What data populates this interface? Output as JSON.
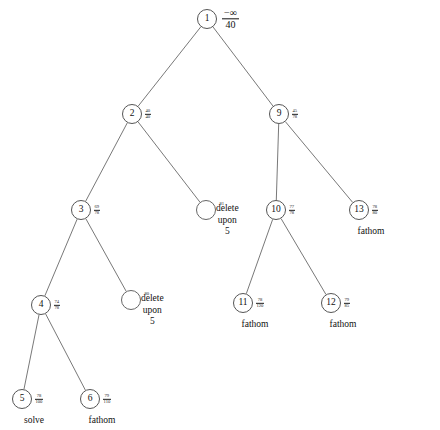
{
  "figure": {
    "type": "branch-and-bound-search-tree",
    "background": "#ffffff",
    "line_color": "#555555",
    "text_color": "#111111"
  },
  "nodes": [
    {
      "id": "n1",
      "label": "1",
      "x": 207,
      "y": 19,
      "bound_num": "−∞",
      "bound_den": "40",
      "status": ""
    },
    {
      "id": "n2",
      "label": "2",
      "x": 132,
      "y": 114,
      "bound_num": "40",
      "bound_den": "40",
      "status": ""
    },
    {
      "id": "n9",
      "label": "9",
      "x": 279,
      "y": 114,
      "bound_num": "45",
      "bound_den": "78",
      "status": ""
    },
    {
      "id": "n3",
      "label": "3",
      "x": 81,
      "y": 210,
      "bound_num": "69",
      "bound_den": "78",
      "status": ""
    },
    {
      "id": "d1",
      "label": "",
      "x": 206,
      "y": 210,
      "bound_num": "81",
      "bound_den": "",
      "status": ""
    },
    {
      "id": "n10",
      "label": "10",
      "x": 276,
      "y": 210,
      "bound_num": "77",
      "bound_den": "78",
      "status": ""
    },
    {
      "id": "n13",
      "label": "13",
      "x": 359,
      "y": 210,
      "bound_num": "78",
      "bound_den": "80",
      "status": "fathom"
    },
    {
      "id": "n4",
      "label": "4",
      "x": 41,
      "y": 305,
      "bound_num": "74",
      "bound_den": "78",
      "status": ""
    },
    {
      "id": "d2",
      "label": "",
      "x": 131,
      "y": 300,
      "bound_num": "80",
      "bound_den": "",
      "status": ""
    },
    {
      "id": "n11",
      "label": "11",
      "x": 243,
      "y": 303,
      "bound_num": "78",
      "bound_den": "120",
      "status": "fathom"
    },
    {
      "id": "n12",
      "label": "12",
      "x": 331,
      "y": 303,
      "bound_num": "79",
      "bound_den": "85",
      "status": "fathom"
    },
    {
      "id": "n5",
      "label": "5",
      "x": 22,
      "y": 399,
      "bound_num": "78",
      "bound_den": "100",
      "status": "solve"
    },
    {
      "id": "n6",
      "label": "6",
      "x": 90,
      "y": 399,
      "bound_num": "79",
      "bound_den": "110",
      "status": "fathom"
    }
  ],
  "edges": [
    {
      "from": "n1",
      "to": "n2"
    },
    {
      "from": "n1",
      "to": "n9"
    },
    {
      "from": "n2",
      "to": "n3"
    },
    {
      "from": "n2",
      "to": "d1"
    },
    {
      "from": "n9",
      "to": "n10"
    },
    {
      "from": "n9",
      "to": "n13"
    },
    {
      "from": "n3",
      "to": "n4"
    },
    {
      "from": "n3",
      "to": "d2"
    },
    {
      "from": "n10",
      "to": "n11"
    },
    {
      "from": "n10",
      "to": "n12"
    },
    {
      "from": "n4",
      "to": "n5"
    },
    {
      "from": "n4",
      "to": "n6"
    }
  ],
  "actions": [
    {
      "id": "a1",
      "x": 216,
      "y": 203,
      "line1": "delete",
      "line2": "upon",
      "line3": "5"
    },
    {
      "id": "a2",
      "x": 141,
      "y": 293,
      "line1": "delete",
      "line2": "upon",
      "line3": "5"
    }
  ],
  "status_labels": {
    "solve": "solve",
    "fathom": "fathom"
  }
}
